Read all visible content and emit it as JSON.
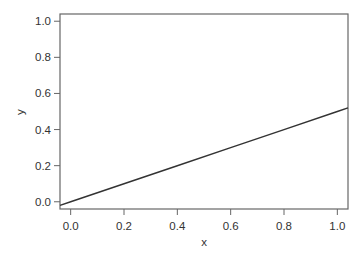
{
  "chart_data": {
    "type": "line",
    "title": "",
    "xlabel": "x",
    "ylabel": "y",
    "xlim": [
      -0.04,
      1.04
    ],
    "ylim": [
      -0.04,
      1.04
    ],
    "xticks": [
      0.0,
      0.2,
      0.4,
      0.6,
      0.8,
      1.0
    ],
    "yticks": [
      0.0,
      0.2,
      0.4,
      0.6,
      0.8,
      1.0
    ],
    "xtick_labels": [
      "0.0",
      "0.2",
      "0.4",
      "0.6",
      "0.8",
      "1.0"
    ],
    "ytick_labels": [
      "0.0",
      "0.2",
      "0.4",
      "0.6",
      "0.8",
      "1.0"
    ],
    "grid": false,
    "legend": null,
    "series": [
      {
        "name": "y = 0.5x",
        "x": [
          -0.04,
          0.0,
          0.2,
          0.4,
          0.6,
          0.8,
          1.0,
          1.04
        ],
        "values": [
          -0.02,
          0.0,
          0.1,
          0.2,
          0.3,
          0.4,
          0.5,
          0.52
        ],
        "color": "#333333"
      }
    ]
  },
  "style": {
    "axis_color": "#666666",
    "line_color": "#333333",
    "text_color": "#333333"
  }
}
